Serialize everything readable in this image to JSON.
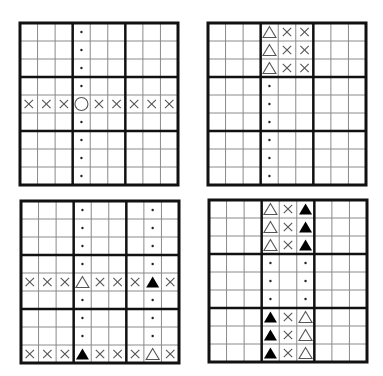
{
  "legend": {
    "x": "cross-mark",
    "c": "hollow-circle",
    "t": "hollow-triangle",
    "T": "filled-triangle",
    ".": "dot",
    "_": "empty"
  },
  "colors": {
    "thick_line": "#111111",
    "thin_line": "#8a8a8a",
    "mark": "#555555",
    "filled": "#000000"
  },
  "grids": [
    {
      "name": "grid-top-left",
      "left": 20,
      "top": 23,
      "rows": [
        "___._____",
        "___._____",
        "___._____",
        "___._____",
        "xxxcxxxxx",
        "___._____",
        "___._____",
        "___._____",
        "___._____"
      ]
    },
    {
      "name": "grid-top-right",
      "left": 208,
      "top": 23,
      "rows": [
        "___txx___",
        "___txx___",
        "___txx___",
        "___._____",
        "___._____",
        "___._____",
        "___._____",
        "___._____",
        "___._____"
      ]
    },
    {
      "name": "grid-bottom-left",
      "left": 21,
      "top": 201,
      "rows": [
        "___.___._",
        "___.___._",
        "___.___._",
        "___.___._",
        "xxxtxxxTx",
        "___.___._",
        "___.___._",
        "___.___._",
        "xxxTxxxtx"
      ]
    },
    {
      "name": "grid-bottom-right",
      "left": 209,
      "top": 200,
      "rows": [
        "___txT___",
        "___txT___",
        "___txT___",
        "___._.___",
        "___._.___",
        "___._.___",
        "___Txt___",
        "___Txt___",
        "___Txt___"
      ]
    }
  ]
}
